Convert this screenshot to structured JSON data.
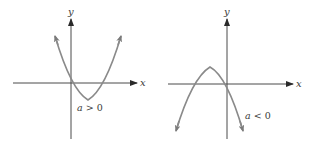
{
  "figure": {
    "colors": {
      "axis": "#4a4a4a",
      "curve": "#8a8a8a",
      "text": "#3a3a3a",
      "background": "#ffffff"
    },
    "panels": [
      {
        "id": "left",
        "x_label": "x",
        "y_label": "y",
        "condition_var": "a",
        "condition_rest": " > 0",
        "opens": "up"
      },
      {
        "id": "right",
        "x_label": "x",
        "y_label": "y",
        "condition_var": "a",
        "condition_rest": " < 0",
        "opens": "down"
      }
    ]
  }
}
